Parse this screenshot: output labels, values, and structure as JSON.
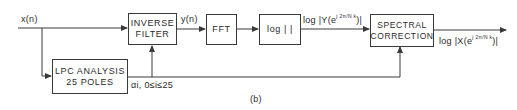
{
  "diagram": {
    "caption": "(b)",
    "signals": {
      "input": "x(n)",
      "filtered": "y(n)",
      "log_spectrum_y": "log|Y(e^{j 2π/N k})|",
      "log_spectrum_y_prefix": "log",
      "log_spectrum_y_body": "|Y(e",
      "log_spectrum_y_exp": "j 2π/N k",
      "log_spectrum_y_suffix": ")|",
      "output": "log|X(e^{j 2π/N k})|",
      "output_prefix": "log",
      "output_body": "|X(e",
      "output_exp": "j 2π/N k",
      "output_suffix": ")|",
      "coefficients": "αi, 0≤i≤25"
    },
    "blocks": [
      {
        "id": "inverse-filter",
        "line1": "INVERSE",
        "line2": "FILTER"
      },
      {
        "id": "fft",
        "line1": "FFT"
      },
      {
        "id": "log-magnitude",
        "line1": "log |  |"
      },
      {
        "id": "spectral-correction",
        "line1": "SPECTRAL",
        "line2": "CORRECTION"
      },
      {
        "id": "lpc-analysis",
        "line1": "LPC ANALYSIS",
        "line2": "25 POLES"
      }
    ],
    "colors": {
      "line": "#3a3a3a",
      "background": "#ffffff"
    }
  }
}
